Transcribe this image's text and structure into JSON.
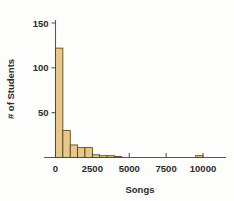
{
  "chart_data": {
    "type": "bar",
    "title": "",
    "subtitle": "",
    "xlabel": "Songs",
    "ylabel": "# of Students",
    "xlim": [
      0,
      11500
    ],
    "ylim": [
      0,
      157
    ],
    "grid": false,
    "legend": null,
    "bin_width": 500,
    "bar_color": "#e8c88a",
    "bar_edge_color": "#4a3a17",
    "axis_color": "#585858",
    "xticks": [
      0,
      2500,
      5000,
      7500,
      10000
    ],
    "xtick_labels": [
      "0",
      "2500",
      "5000",
      "7500",
      "10000"
    ],
    "yticks": [
      50,
      100,
      150
    ],
    "ytick_labels": [
      "50",
      "100",
      "150"
    ],
    "bins": [
      {
        "x0": 0,
        "x1": 500,
        "value": 122
      },
      {
        "x0": 500,
        "x1": 1000,
        "value": 30
      },
      {
        "x0": 1000,
        "x1": 1500,
        "value": 14
      },
      {
        "x0": 1500,
        "x1": 2000,
        "value": 11
      },
      {
        "x0": 2000,
        "x1": 2500,
        "value": 11
      },
      {
        "x0": 2500,
        "x1": 3000,
        "value": 3
      },
      {
        "x0": 3000,
        "x1": 3500,
        "value": 2
      },
      {
        "x0": 3500,
        "x1": 4000,
        "value": 2
      },
      {
        "x0": 4000,
        "x1": 4500,
        "value": 1
      },
      {
        "x0": 9500,
        "x1": 10000,
        "value": 2
      }
    ],
    "categories": [
      "0-500",
      "500-1000",
      "1000-1500",
      "1500-2000",
      "2000-2500",
      "2500-3000",
      "3000-3500",
      "3500-4000",
      "4000-4500",
      "9500-10000"
    ],
    "values": [
      122,
      30,
      14,
      11,
      11,
      3,
      2,
      2,
      1,
      2
    ]
  },
  "axes": {
    "x_title": "Songs",
    "y_title": "# of Students"
  }
}
